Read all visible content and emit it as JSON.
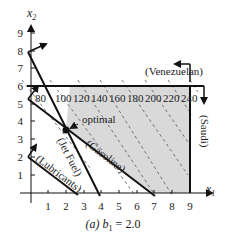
{
  "diagram": {
    "caption": {
      "prefix": "(a) b",
      "subscript": "1",
      "suffix": " = 2.0"
    },
    "axes": {
      "x_label": "x",
      "x_sub": "1",
      "y_label": "x",
      "y_sub": "2",
      "x_ticks": [
        "1",
        "2",
        "3",
        "4",
        "5",
        "6",
        "7",
        "8",
        "9"
      ],
      "y_ticks": [
        "1",
        "2",
        "3",
        "4",
        "5",
        "6",
        "7",
        "8",
        "9"
      ]
    },
    "constraints": {
      "venezuelan": "(Venezuelan)",
      "saudi": "(Saudi)",
      "jet_fuel": "(Jet Fuel)",
      "gasoline": "(Gasoline)",
      "lubricants": "(Lubricants)"
    },
    "objective_contours": [
      "80",
      "100",
      "120",
      "140",
      "160",
      "180",
      "200",
      "220",
      "240"
    ],
    "optimal_label": "optimal",
    "colors": {
      "feasible_fill": "#d9d9d9",
      "line": "#111111",
      "dashed": "#555555"
    }
  }
}
